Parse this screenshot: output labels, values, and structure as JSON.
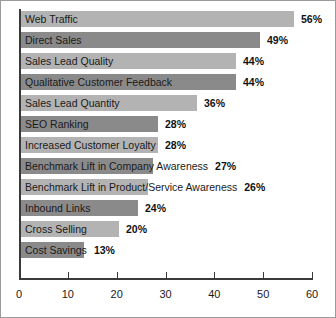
{
  "chart_data": {
    "type": "bar",
    "orientation": "horizontal",
    "title": "",
    "xlabel": "",
    "ylabel": "",
    "xlim": [
      0,
      60
    ],
    "xticks": [
      0,
      10,
      20,
      30,
      40,
      50,
      60
    ],
    "grid": false,
    "legend": "none",
    "value_suffix": "%",
    "categories": [
      "Web Traffic",
      "Direct Sales",
      "Sales Lead Quality",
      "Qualitative Customer Feedback",
      "Sales Lead Quantity",
      "SEO Ranking",
      "Increased Customer Loyalty",
      "Benchmark Lift in Company Awareness",
      "Benchmark Lift in Product/Service Awareness",
      "Inbound Links",
      "Cross Selling",
      "Cost Savings"
    ],
    "values": [
      56,
      49,
      44,
      44,
      36,
      28,
      28,
      27,
      26,
      24,
      20,
      13
    ],
    "value_labels": [
      "56%",
      "49%",
      "44%",
      "44%",
      "36%",
      "28%",
      "28%",
      "27%",
      "26%",
      "24%",
      "20%",
      "13%"
    ],
    "colors": {
      "bar_light": "#b3b3b3",
      "bar_dark": "#8a8a8a",
      "axis": "#3a3a3a",
      "text": "#1a1a1a",
      "frame": "#9a9a9a",
      "background": "#ffffff"
    }
  }
}
